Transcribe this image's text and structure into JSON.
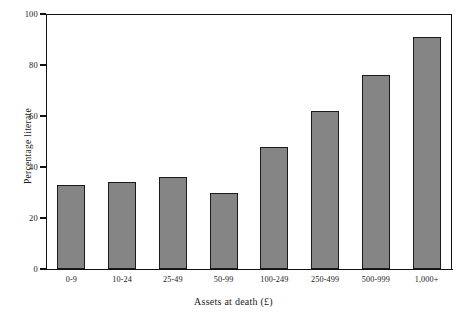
{
  "chart_data": {
    "type": "bar",
    "title": "",
    "subtitle": "",
    "xlabel": "Assets at death (£)",
    "ylabel": "Percentage literate",
    "categories": [
      "0-9",
      "10-24",
      "25-49",
      "50-99",
      "100-249",
      "250-499",
      "500-999",
      "1,000+"
    ],
    "values": [
      33,
      34,
      36,
      30,
      48,
      62,
      76,
      91
    ],
    "series": [
      {
        "name": "Percentage literate",
        "values": [
          33,
          34,
          36,
          30,
          48,
          62,
          76,
          91
        ]
      }
    ],
    "ylim": [
      0,
      100
    ],
    "y_ticks": [
      0,
      20,
      40,
      60,
      80,
      100
    ],
    "y_tick_labels": [
      "0",
      "20",
      "40",
      "60",
      "80",
      "100"
    ],
    "grid": false,
    "legend": false,
    "legend_position": "none",
    "annotations": [],
    "bar_fill_color": "#858585",
    "bar_edge_color": "#1b1b1b",
    "axis_color": "#111111",
    "background_color": "#ffffff"
  },
  "figure": {
    "name": "percentage-literate-by-assets-at-death-bar-chart"
  }
}
